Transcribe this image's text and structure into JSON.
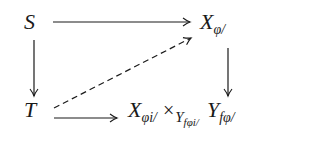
{
  "diagram": {
    "type": "commutative-square",
    "nodes": {
      "top_left": {
        "label": "S"
      },
      "top_right": {
        "main": "X",
        "subscript": "φ/"
      },
      "bottom_left": {
        "label": "T"
      },
      "bottom_right": {
        "factor1_main": "X",
        "factor1_subscript": "φi/",
        "operator": "×",
        "base_main": "Y",
        "base_subscript": "fφi/",
        "factor2_main": "Y",
        "factor2_subscript": "fφ/"
      }
    },
    "arrows": [
      {
        "from": "S",
        "to": "X_φ/",
        "style": "solid",
        "direction": "right"
      },
      {
        "from": "S",
        "to": "T",
        "style": "solid",
        "direction": "down"
      },
      {
        "from": "X_φ/",
        "to": "X_φi/ ×_{Y_fφi/} Y_fφ/",
        "style": "solid",
        "direction": "down"
      },
      {
        "from": "T",
        "to": "X_φi/ ×_{Y_fφi/} Y_fφ/",
        "style": "solid",
        "direction": "right"
      },
      {
        "from": "T",
        "to": "X_φ/",
        "style": "dashed",
        "direction": "diagonal-up-right"
      }
    ],
    "colors": {
      "ink": "#1a1a1a",
      "background": "#ffffff"
    }
  }
}
